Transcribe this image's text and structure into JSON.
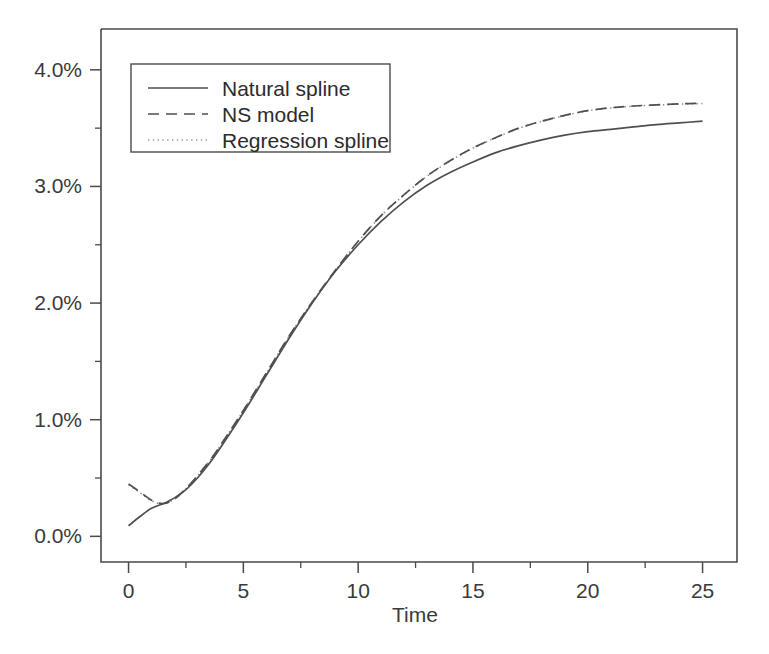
{
  "chart_data": {
    "type": "line",
    "title": "",
    "xlabel": "Time",
    "ylabel": "",
    "xlim": [
      -1.2,
      26.5
    ],
    "ylim": [
      -0.22,
      4.35
    ],
    "grid": false,
    "legend_position": "top-left",
    "x_ticks": [
      0,
      5,
      10,
      15,
      20,
      25
    ],
    "x_tick_labels": [
      "0",
      "5",
      "10",
      "15",
      "20",
      "25"
    ],
    "x_minor_ticks": [
      2.5,
      7.5,
      12.5,
      17.5,
      22.5
    ],
    "y_ticks": [
      0,
      1,
      2,
      3,
      4
    ],
    "y_tick_labels": [
      "0.0%",
      "1.0%",
      "2.0%",
      "3.0%",
      "4.0%"
    ],
    "y_minor_ticks": [
      0.5,
      1.5,
      2.5,
      3.5
    ],
    "y_unit": "percent",
    "series": [
      {
        "name": "Natural spline",
        "style": "solid",
        "color": "#4f4f4f",
        "x": [
          0,
          0.5,
          1,
          1.5,
          2,
          2.5,
          3,
          3.5,
          4,
          5,
          6,
          7,
          8,
          9,
          10,
          11,
          12,
          13,
          14,
          15,
          16,
          17,
          18,
          19,
          20,
          21,
          22,
          23,
          24,
          25
        ],
        "values": [
          0.09,
          0.17,
          0.24,
          0.28,
          0.33,
          0.4,
          0.5,
          0.62,
          0.76,
          1.06,
          1.38,
          1.7,
          2.0,
          2.27,
          2.5,
          2.7,
          2.87,
          3.01,
          3.12,
          3.21,
          3.29,
          3.35,
          3.4,
          3.44,
          3.47,
          3.49,
          3.51,
          3.53,
          3.545,
          3.56
        ]
      },
      {
        "name": "NS model",
        "style": "dashed",
        "color": "#4f4f4f",
        "x": [
          0,
          0.5,
          1,
          1.5,
          2,
          2.5,
          3,
          3.5,
          4,
          5,
          6,
          7,
          8,
          9,
          10,
          11,
          12,
          13,
          14,
          15,
          16,
          17,
          18,
          19,
          20,
          21,
          22,
          23,
          24,
          25
        ],
        "values": [
          0.45,
          0.38,
          0.31,
          0.28,
          0.32,
          0.41,
          0.52,
          0.64,
          0.78,
          1.08,
          1.4,
          1.72,
          2.01,
          2.28,
          2.53,
          2.75,
          2.93,
          3.09,
          3.22,
          3.33,
          3.42,
          3.5,
          3.56,
          3.61,
          3.65,
          3.675,
          3.69,
          3.7,
          3.708,
          3.713
        ]
      },
      {
        "name": "Regression spline",
        "style": "dotted",
        "color": "#9a9a9a",
        "x": [
          0,
          0.5,
          1,
          1.5,
          2,
          2.5,
          3,
          3.5,
          4,
          5,
          6,
          7,
          8,
          9,
          10,
          11,
          12,
          13,
          14,
          15,
          16,
          17,
          18,
          19,
          20,
          21,
          22,
          23,
          24,
          25
        ],
        "values": [
          0.44,
          0.375,
          0.305,
          0.278,
          0.318,
          0.408,
          0.518,
          0.638,
          0.778,
          1.078,
          1.398,
          1.718,
          2.008,
          2.278,
          2.528,
          2.748,
          2.928,
          3.088,
          3.218,
          3.328,
          3.418,
          3.498,
          3.558,
          3.608,
          3.648,
          3.673,
          3.688,
          3.698,
          3.706,
          3.711
        ]
      }
    ]
  },
  "axes": {
    "x_title": "Time",
    "y_title": ""
  },
  "legend": {
    "entries": [
      {
        "label": "Natural spline",
        "style": "solid"
      },
      {
        "label": "NS model",
        "style": "dashed"
      },
      {
        "label": "Regression spline",
        "style": "dotted"
      }
    ]
  },
  "colors": {
    "background": "#ffffff",
    "axis": "#4a4a4a",
    "text": "#2b2b2b",
    "series_primary": "#4f4f4f",
    "series_dotted": "#9a9a9a"
  }
}
